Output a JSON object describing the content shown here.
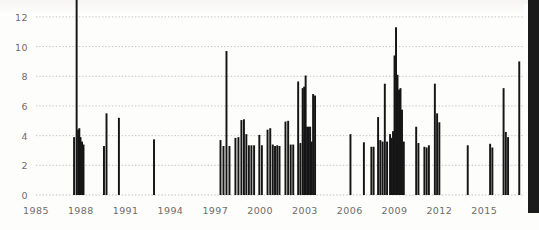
{
  "figure": {
    "name": "publications-per-year-histogram",
    "background_color": "#fdfdfc",
    "bar_color": "#151515",
    "grid_color": "#b9b8b6",
    "axis_color": "#8b8a88",
    "tick_label_color": "#6d6c6a",
    "page_edge_color": "#1b1b1b"
  },
  "chart_data": {
    "type": "bar",
    "title": "",
    "subtitle": "",
    "xlabel": "",
    "ylabel": "",
    "grid": true,
    "grid_style": "dotted-horizontal",
    "legend": "none",
    "xlim": [
      1985,
      2017.6
    ],
    "ylim": [
      0,
      12.6
    ],
    "y_ticks": [
      0,
      2,
      4,
      6,
      8,
      10,
      12
    ],
    "y_tick_labels": [
      "0",
      "2",
      "4",
      "6",
      "8",
      "10",
      "12"
    ],
    "x_ticks": [
      1985,
      1988,
      1991,
      1994,
      1997,
      2000,
      2003,
      2006,
      2009,
      2012,
      2015
    ],
    "x_tick_labels": [
      "1985",
      "1988",
      "1991",
      "1994",
      "1997",
      "2000",
      "2003",
      "2006",
      "2009",
      "2012",
      "2015"
    ],
    "x_tick_interval_years": 3,
    "bar_width_units": 0.13,
    "note": "Dense spike histogram; x positions given in fractional years, values on the y scale 0-12.",
    "x": [
      1987.55,
      1987.72,
      1987.82,
      1987.9,
      1987.98,
      1988.08,
      1988.18,
      1989.55,
      1989.72,
      1990.55,
      1992.9,
      1997.35,
      1997.55,
      1997.75,
      1997.95,
      1998.35,
      1998.55,
      1998.75,
      1998.92,
      1999.08,
      1999.25,
      1999.42,
      1999.6,
      1999.95,
      2000.12,
      2000.5,
      2000.68,
      2000.85,
      2001.0,
      2001.15,
      2001.3,
      2001.7,
      2001.88,
      2002.05,
      2002.22,
      2002.55,
      2002.7,
      2002.85,
      2002.95,
      2003.05,
      2003.15,
      2003.25,
      2003.35,
      2003.45,
      2003.55,
      2003.68,
      2006.05,
      2006.95,
      2007.45,
      2007.6,
      2007.9,
      2008.05,
      2008.2,
      2008.35,
      2008.5,
      2008.7,
      2008.8,
      2008.9,
      2009.0,
      2009.1,
      2009.2,
      2009.3,
      2009.4,
      2009.5,
      2009.62,
      2010.45,
      2010.6,
      2011.0,
      2011.15,
      2011.3,
      2011.7,
      2011.85,
      2012.0,
      2013.9,
      2015.4,
      2015.55,
      2016.3,
      2016.45,
      2016.6,
      2017.35
    ],
    "values": [
      3.9,
      13.2,
      4.4,
      4.5,
      3.9,
      3.6,
      3.4,
      3.3,
      5.5,
      5.2,
      3.75,
      3.7,
      3.3,
      9.7,
      3.3,
      3.85,
      3.9,
      5.05,
      5.1,
      4.1,
      3.35,
      3.35,
      3.35,
      4.05,
      3.35,
      4.4,
      4.5,
      3.4,
      3.3,
      3.35,
      3.3,
      4.95,
      5.0,
      3.4,
      3.4,
      7.65,
      3.5,
      7.2,
      7.3,
      8.05,
      4.6,
      4.6,
      4.6,
      3.6,
      6.8,
      6.7,
      4.1,
      3.55,
      3.25,
      3.25,
      5.25,
      3.7,
      3.6,
      7.5,
      3.6,
      4.1,
      3.85,
      4.3,
      9.4,
      11.3,
      8.1,
      7.1,
      7.2,
      5.75,
      3.6,
      4.6,
      3.5,
      3.25,
      3.2,
      3.35,
      7.5,
      5.5,
      4.9,
      3.35,
      3.45,
      3.2,
      7.2,
      4.25,
      3.9,
      9.0
    ]
  }
}
